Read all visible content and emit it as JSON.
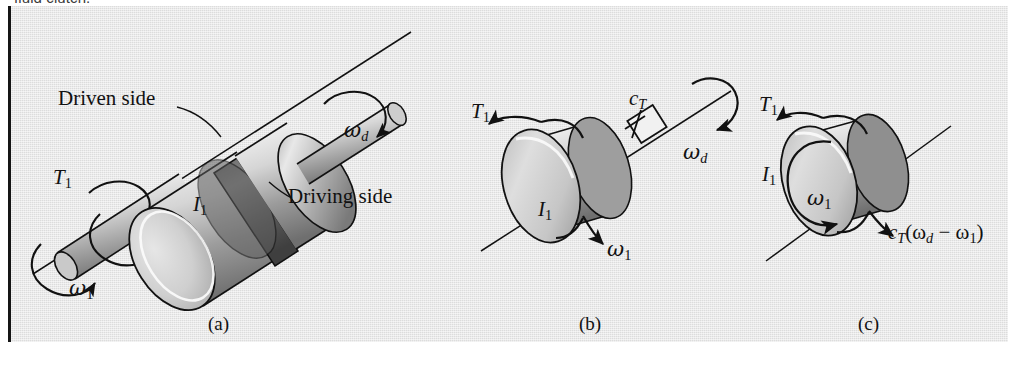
{
  "page": {
    "cropped_text_above_figure": "fluid clutch.",
    "panel_background": "#e3e3e3",
    "border_color": "#151515",
    "ink_color": "#111111"
  },
  "figure": {
    "subfigures": [
      {
        "id": "a",
        "caption": "(a)",
        "description": "fluid clutch assembly: driven-side drum and driving-side drum on a common shaft",
        "labels": {
          "driven_side": "Driven side",
          "driving_side": "Driving side",
          "torque": "T",
          "torque_sub": "1",
          "inertia": "I",
          "inertia_sub": "1",
          "omega_driven": "ω",
          "omega_driven_sub": "1",
          "omega_driving": "ω",
          "omega_driving_sub": "d"
        }
      },
      {
        "id": "b",
        "caption": "(b)",
        "description": "free body: disk I1 connected through torsional damper cT to shaft rotating at omega d",
        "labels": {
          "torque": "T",
          "torque_sub": "1",
          "inertia": "I",
          "inertia_sub": "1",
          "damping": "c",
          "damping_sub": "T",
          "omega_disk": "ω",
          "omega_disk_sub": "1",
          "omega_shaft": "ω",
          "omega_shaft_sub": "d"
        }
      },
      {
        "id": "c",
        "caption": "(c)",
        "description": "free body diagram of disk I1 with applied torque T1 and damping torque",
        "labels": {
          "torque": "T",
          "torque_sub": "1",
          "inertia": "I",
          "inertia_sub": "1",
          "omega_disk": "ω",
          "omega_disk_sub": "1",
          "damping_torque_prefix": "c",
          "damping_torque_sub": "T",
          "damping_torque_expr": "(ω",
          "damping_torque_expr_sub1": "d",
          "damping_torque_minus": " − ω",
          "damping_torque_sub2": "1",
          "damping_torque_close": ")"
        }
      }
    ]
  }
}
